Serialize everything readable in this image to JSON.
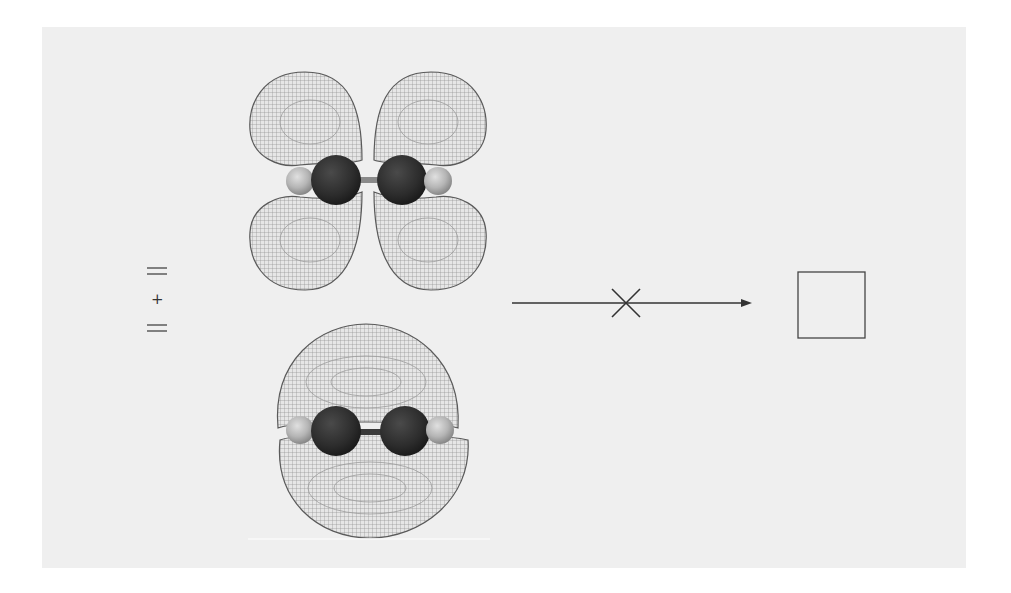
{
  "diagram": {
    "panel_color": "#efefef",
    "line_color": "#333333",
    "reactants": {
      "first_alkene_symbol": "double-bond",
      "operator": "+",
      "second_alkene_symbol": "double-bond"
    },
    "orbitals": [
      {
        "name": "pi-antibonding-or-p-lobes",
        "position": "top",
        "lobes": 4,
        "molecule": "ethylene",
        "atoms": [
          "H",
          "C",
          "C",
          "H"
        ]
      },
      {
        "name": "pi-bonding",
        "position": "bottom",
        "lobes": 2,
        "molecule": "ethylene",
        "atoms": [
          "H",
          "C",
          "C",
          "H"
        ]
      }
    ],
    "reaction_arrow": {
      "direction": "right",
      "blocked": true,
      "blocked_marker": "cross"
    },
    "product": {
      "shape": "square",
      "meaning": "cyclobutane"
    },
    "colors": {
      "mesh": "#6e6e6e",
      "carbon": "#2e2e2e",
      "hydrogen": "#b9b9b9",
      "bond": "#8a8a8a"
    }
  }
}
